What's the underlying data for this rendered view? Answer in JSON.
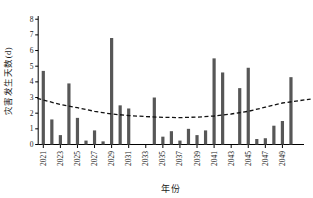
{
  "chart_data": {
    "type": "bar",
    "title": "",
    "xlabel": "年份",
    "ylabel": "灾害发生天数(d)",
    "ylim": [
      0,
      8
    ],
    "yticks": [
      0,
      1,
      2,
      3,
      4,
      5,
      6,
      7,
      8
    ],
    "xtick_years": [
      2021,
      2023,
      2025,
      2027,
      2029,
      2031,
      2033,
      2035,
      2037,
      2039,
      2041,
      2043,
      2045,
      2047,
      2049
    ],
    "categories": [
      2021,
      2022,
      2023,
      2024,
      2025,
      2026,
      2027,
      2028,
      2029,
      2030,
      2031,
      2032,
      2033,
      2034,
      2035,
      2036,
      2037,
      2038,
      2039,
      2040,
      2041,
      2042,
      2043,
      2044,
      2045,
      2046,
      2047,
      2048,
      2049,
      2050
    ],
    "values": [
      4.7,
      1.6,
      0.6,
      3.9,
      1.7,
      0.25,
      0.9,
      0.2,
      6.8,
      2.5,
      2.3,
      0,
      0,
      3.0,
      0.5,
      0.85,
      0.25,
      1.0,
      0.6,
      0.9,
      5.5,
      4.6,
      0,
      3.6,
      4.9,
      0.35,
      0.4,
      1.2,
      1.5,
      4.3
    ],
    "trendline": {
      "style": "dashed",
      "x": [
        2020.3,
        2023,
        2025,
        2027,
        2029,
        2031,
        2033,
        2035,
        2037,
        2039,
        2041,
        2043,
        2045,
        2047,
        2049,
        2052.3
      ],
      "y": [
        2.95,
        2.55,
        2.35,
        2.12,
        1.95,
        1.85,
        1.78,
        1.74,
        1.72,
        1.75,
        1.82,
        1.95,
        2.12,
        2.38,
        2.65,
        2.9
      ]
    },
    "legend": "none",
    "grid": "off",
    "bar_color": "#575757",
    "trend_color": "#111111",
    "axis_color": "#000000",
    "text_color": "#1a1a1a"
  }
}
